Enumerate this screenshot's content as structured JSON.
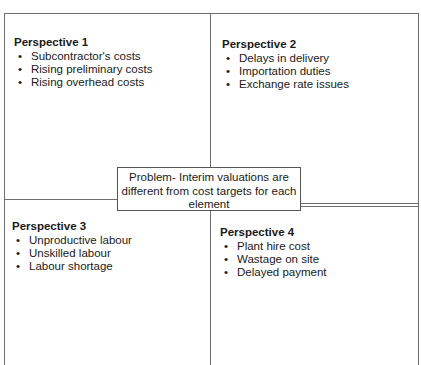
{
  "diagram": {
    "type": "four-perspective problem framing",
    "problem": "Problem- Interim valuations are different from cost targets for each element",
    "quadrants": [
      {
        "title": "Perspective 1",
        "items": [
          "Subcontractor's costs",
          "Rising preliminary costs",
          "Rising overhead costs"
        ]
      },
      {
        "title": "Perspective 2",
        "items": [
          "Delays in delivery",
          "Importation duties",
          "Exchange rate issues"
        ]
      },
      {
        "title": "Perspective 3",
        "items": [
          "Unproductive labour",
          "Unskilled labour",
          "Labour shortage"
        ]
      },
      {
        "title": "Perspective 4",
        "items": [
          "Plant hire cost",
          "Wastage on site",
          "Delayed payment"
        ]
      }
    ],
    "colors": {
      "line": "#6e6e6e",
      "text": "#1a1a1a",
      "background": "#ffffff"
    }
  }
}
